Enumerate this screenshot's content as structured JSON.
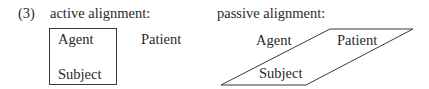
{
  "example_number": "(3)",
  "active": {
    "heading": "active alignment:",
    "boxed_labels": [
      "Agent",
      "Subject"
    ],
    "outside_label": "Patient"
  },
  "passive": {
    "heading": "passive alignment:",
    "outside_label": "Agent",
    "boxed_labels": [
      "Patient",
      "Subject"
    ]
  },
  "colors": {
    "line": "#3a3a3a",
    "text": "#2a2a2a"
  }
}
